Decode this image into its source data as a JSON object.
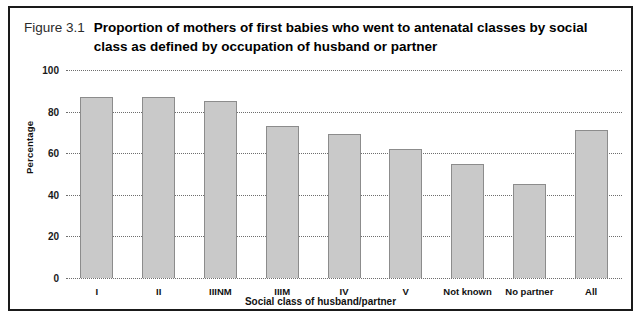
{
  "figure": {
    "number": "Figure 3.1",
    "title": "Proportion of mothers of first babies who went to antenatal classes by social class as defined by occupation of husband or partner"
  },
  "chart_data": {
    "type": "bar",
    "title": "Proportion of mothers of first babies who went to antenatal classes by social class as defined by occupation of husband or partner",
    "categories": [
      "I",
      "II",
      "IIINM",
      "IIIM",
      "IV",
      "V",
      "Not known",
      "No partner",
      "All"
    ],
    "values": [
      87,
      87,
      85,
      73,
      69,
      62,
      55,
      45,
      71
    ],
    "xlabel": "Social class of husband/partner",
    "ylabel": "Percentage",
    "ylim": [
      0,
      100
    ],
    "yticks": [
      0,
      20,
      40,
      60,
      80,
      100
    ],
    "ytick_labels": [
      "0",
      "20",
      "40",
      "60",
      "80",
      "100"
    ],
    "grid": true,
    "legend": false,
    "bar_color": "#c9c9c9",
    "bar_border_color": "#8c8c8c",
    "gridline_color": "#6e6e6e",
    "frame_color": "#1a1a1a"
  }
}
